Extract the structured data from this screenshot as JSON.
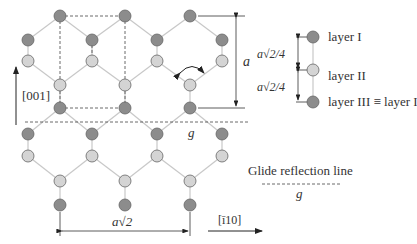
{
  "colors": {
    "dark_atom": "#8c8c8c",
    "light_atom": "#d4d4d4",
    "atom_stroke": "#666666",
    "bond": "#c8c8c8",
    "line": "#333333"
  },
  "labels": {
    "direction_vertical": "[001]",
    "direction_horizontal": "[ī10]",
    "lattice_a": "a",
    "lattice_a_sqrt2": "a√2",
    "glide_g_on_line": "g",
    "legend_spacing_1": "a√2/4",
    "legend_spacing_2": "a√2/4",
    "legend_layer1": "layer I",
    "legend_layer2": "layer II",
    "legend_layer3": "layer III ≡ layer I",
    "glide_legend_title": "Glide reflection line",
    "glide_legend_symbol": "g"
  },
  "atoms": {
    "dark": [
      [
        60,
        16
      ],
      [
        125,
        16
      ],
      [
        190,
        16
      ],
      [
        28,
        40
      ],
      [
        92,
        40
      ],
      [
        157,
        40
      ],
      [
        222,
        40
      ],
      [
        60,
        108
      ],
      [
        125,
        108
      ],
      [
        190,
        108
      ],
      [
        28,
        134
      ],
      [
        92,
        134
      ],
      [
        157,
        134
      ],
      [
        222,
        134
      ],
      [
        60,
        205
      ],
      [
        125,
        205
      ],
      [
        190,
        205
      ]
    ],
    "light": [
      [
        28,
        61
      ],
      [
        92,
        61
      ],
      [
        157,
        61
      ],
      [
        222,
        61
      ],
      [
        60,
        85
      ],
      [
        125,
        85
      ],
      [
        190,
        85
      ],
      [
        28,
        156
      ],
      [
        92,
        156
      ],
      [
        157,
        156
      ],
      [
        222,
        156
      ],
      [
        60,
        181
      ],
      [
        125,
        181
      ],
      [
        190,
        181
      ]
    ]
  }
}
